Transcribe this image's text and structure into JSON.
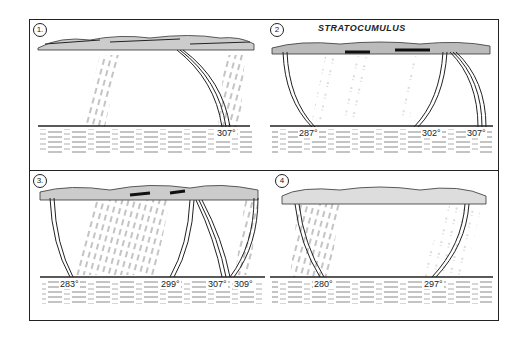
{
  "figure": {
    "title": "STRATOCUMULUS",
    "panels": [
      {
        "number": "1.",
        "labels": [
          "307°"
        ]
      },
      {
        "number": "2",
        "labels": [
          "287°",
          "302°",
          "307°"
        ]
      },
      {
        "number": "3.",
        "labels": [
          "283°",
          "299°",
          "307°",
          "309°"
        ]
      },
      {
        "number": "4",
        "labels": [
          "280°",
          "297°"
        ]
      }
    ]
  }
}
